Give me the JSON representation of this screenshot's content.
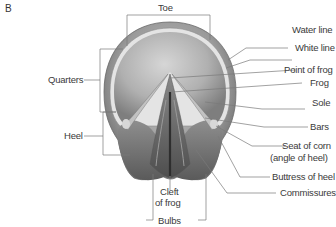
{
  "figure": {
    "panel_label": "B",
    "colors": {
      "background": "#ffffff",
      "leader_line": "#7a7a7a",
      "label_text": "#3a3a3a",
      "hoof_wall": "#8c8c8c",
      "sole": "#b4b4b4",
      "frog": "#6e6e6e"
    }
  },
  "labels": {
    "toe": "Toe",
    "quarters": "Quarters",
    "heel": "Heel",
    "cleft_line1": "Cleft",
    "cleft_line2": "of frog",
    "bulbs": "Bulbs",
    "water_line": "Water line",
    "white_line": "White line",
    "point_of_frog": "Point of frog",
    "frog": "Frog",
    "sole": "Sole",
    "bars": "Bars",
    "seat_of_corn_line1": "Seat of corn",
    "seat_of_corn_line2": "(angle of heel)",
    "buttress_of_heel": "Buttress of heel",
    "commissures": "Commissures"
  }
}
